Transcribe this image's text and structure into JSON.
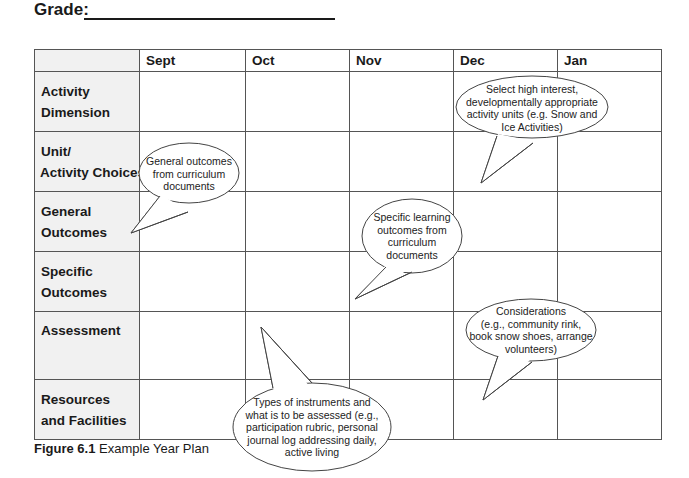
{
  "header": {
    "grade_label": "Grade:"
  },
  "table": {
    "columns": [
      "",
      "Sept",
      "Oct",
      "Nov",
      "Dec",
      "Jan"
    ],
    "rows": [
      {
        "label_line1": "Activity",
        "label_line2": "Dimension"
      },
      {
        "label_line1": "Unit/",
        "label_line2": "Activity Choices"
      },
      {
        "label_line1": "General",
        "label_line2": "Outcomes"
      },
      {
        "label_line1": "Specific",
        "label_line2": "Outcomes"
      },
      {
        "label_line1": "Assessment",
        "label_line2": ""
      },
      {
        "label_line1": "Resources",
        "label_line2": "and Facilities"
      }
    ]
  },
  "callouts": [
    {
      "id": "general-outcomes",
      "lines": [
        "General outcomes",
        "from curriculum",
        "documents"
      ]
    },
    {
      "id": "unit-choices",
      "lines": [
        "Select high interest,",
        "developmentally appropriate",
        "activity units (e.g. Snow and",
        "Ice Activities)"
      ]
    },
    {
      "id": "specific-outcomes",
      "lines": [
        "Specific learning",
        "outcomes from",
        "curriculum",
        "documents"
      ]
    },
    {
      "id": "resources",
      "lines": [
        "Considerations",
        "(e.g., community rink,",
        "book snow shoes, arrange",
        "volunteers)"
      ]
    },
    {
      "id": "assessment",
      "lines": [
        "Types of instruments and",
        "what is to be assessed (e.g.,",
        "participation rubric, personal",
        "journal log addressing daily,",
        "active living"
      ]
    }
  ],
  "caption": {
    "label": "Figure 6.1",
    "text": " Example Year Plan"
  }
}
